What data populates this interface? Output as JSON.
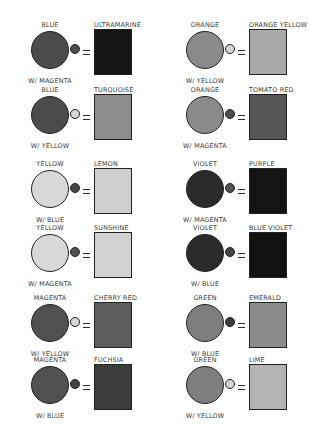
{
  "colors": {
    "blue": "#4a4a4a",
    "orange": "#8a8a8a",
    "yellow": "#d6d6d6",
    "violet": "#262626",
    "magenta": "#555555",
    "green": "#7c7c7c",
    "small_magenta": "#4e4e4e",
    "small_yellow": "#d4d4d4",
    "small_blue": "#3c3c3c"
  },
  "mixes": [
    {
      "base": "BLUE",
      "with": "W/ MAGENTA",
      "result": "ULTRAMARINE",
      "base_color": "#4b4b4b",
      "mix_color": "#4e4e4e",
      "result_color": "#141414"
    },
    {
      "base": "BLUE",
      "with": "W/ YELLOW",
      "result": "TURQUOISE",
      "base_color": "#4b4b4b",
      "mix_color": "#d4d4d4",
      "result_color": "#8c8c8c"
    },
    {
      "base": "ORANGE",
      "with": "W/ YELLOW",
      "result": "ORANGE YELLOW",
      "base_color": "#8a8a8a",
      "mix_color": "#d4d4d4",
      "result_color": "#a9a9a9"
    },
    {
      "base": "ORANGE",
      "with": "W/ MAGENTA",
      "result": "TOMATO RED",
      "base_color": "#8a8a8a",
      "mix_color": "#4e4e4e",
      "result_color": "#555555"
    },
    {
      "base": "YELLOW",
      "with": "W/ BLUE",
      "result": "LEMON",
      "base_color": "#d8d8d8",
      "mix_color": "#444444",
      "result_color": "#cfcfcf"
    },
    {
      "base": "YELLOW",
      "with": "W/ MAGENTA",
      "result": "SUNSHINE",
      "base_color": "#d8d8d8",
      "mix_color": "#4e4e4e",
      "result_color": "#d2d2d2"
    },
    {
      "base": "VIOLET",
      "with": "W/ MAGENTA",
      "result": "PURPLE",
      "base_color": "#2a2a2a",
      "mix_color": "#505050",
      "result_color": "#141414"
    },
    {
      "base": "VIOLET",
      "with": "W/ BLUE",
      "result": "BLUE VIOLET",
      "base_color": "#2a2a2a",
      "mix_color": "#444444",
      "result_color": "#111111"
    },
    {
      "base": "MAGENTA",
      "with": "W/ YELLOW",
      "result": "CHERRY RED",
      "base_color": "#505050",
      "mix_color": "#d4d4d4",
      "result_color": "#5c5c5c"
    },
    {
      "base": "MAGENTA",
      "with": "W/ BLUE",
      "result": "FUCHSIA",
      "base_color": "#505050",
      "mix_color": "#444444",
      "result_color": "#3c3c3c"
    },
    {
      "base": "GREEN",
      "with": "W/ BLUE",
      "result": "EMERALD",
      "base_color": "#7e7e7e",
      "mix_color": "#3a3a3a",
      "result_color": "#8a8a8a"
    },
    {
      "base": "GREEN",
      "with": "W/ YELLOW",
      "result": "LIME",
      "base_color": "#7e7e7e",
      "mix_color": "#d4d4d4",
      "result_color": "#b4b4b4"
    }
  ]
}
